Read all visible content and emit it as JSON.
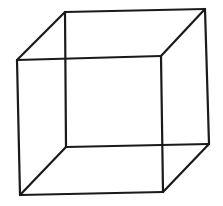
{
  "figure": {
    "type": "wireframe-cube",
    "stroke_color": "#1a1a1a",
    "background": "#ffffff",
    "stroke_width": 2.2,
    "vertices": {
      "back_top_left": [
        65,
        12
      ],
      "back_top_right": [
        205,
        9
      ],
      "back_bottom_left": [
        66,
        147
      ],
      "back_bottom_right": [
        209,
        144
      ],
      "front_top_left": [
        17,
        60
      ],
      "front_top_right": [
        161,
        56
      ],
      "front_bottom_left": [
        20,
        195
      ],
      "front_bottom_right": [
        163,
        192
      ]
    },
    "edges": [
      [
        "front_top_left",
        "front_top_right"
      ],
      [
        "front_top_right",
        "front_bottom_right"
      ],
      [
        "front_bottom_right",
        "front_bottom_left"
      ],
      [
        "front_bottom_left",
        "front_top_left"
      ],
      [
        "back_top_left",
        "back_top_right"
      ],
      [
        "back_top_right",
        "back_bottom_right"
      ],
      [
        "back_bottom_right",
        "back_bottom_left"
      ],
      [
        "back_bottom_left",
        "back_top_left"
      ],
      [
        "front_top_left",
        "back_top_left"
      ],
      [
        "front_top_right",
        "back_top_right"
      ],
      [
        "front_bottom_left",
        "back_bottom_left"
      ],
      [
        "front_bottom_right",
        "back_bottom_right"
      ]
    ]
  }
}
